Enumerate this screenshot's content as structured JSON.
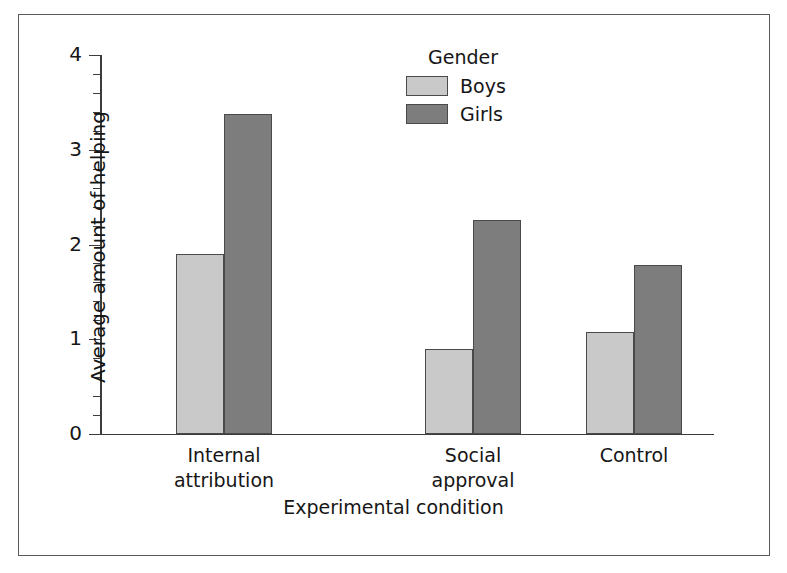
{
  "chart_data": {
    "type": "bar",
    "title": "",
    "subtitle": "",
    "xlabel": "Experimental condition",
    "ylabel": "Average amount of helping",
    "categories": [
      "Internal\nattribution",
      "Social\napproval",
      "Control"
    ],
    "series": [
      {
        "name": "Boys",
        "values": [
          1.9,
          0.9,
          1.08
        ],
        "color": "#c9c9c9"
      },
      {
        "name": "Girls",
        "values": [
          3.38,
          2.26,
          1.78
        ],
        "color": "#7d7d7d"
      }
    ],
    "legend": {
      "title": "Gender",
      "position": "top-center-right",
      "entries": [
        "Boys",
        "Girls"
      ]
    },
    "ylim": [
      0,
      4
    ],
    "yticks": [
      0,
      1,
      2,
      3,
      4
    ],
    "ytick_labels": [
      "0",
      "1",
      "2",
      "3",
      "4"
    ],
    "yminor_tick_interval": 0.2,
    "grid": false,
    "bar_gap_within_group": 0,
    "frame": true
  },
  "axis": {
    "y_labels": [
      "4",
      "3",
      "2",
      "1",
      "0"
    ],
    "title_y": "Average amount of helping",
    "title_x": "Experimental condition"
  },
  "legend": {
    "title": "Gender",
    "items": [
      {
        "label": "Boys",
        "color": "#c9c9c9"
      },
      {
        "label": "Girls",
        "color": "#7d7d7d"
      }
    ]
  },
  "groups": [
    {
      "label": "Internal\nattribution",
      "boys": 1.9,
      "girls": 3.38
    },
    {
      "label": "Social\napproval",
      "boys": 0.9,
      "girls": 2.26
    },
    {
      "label": "Control",
      "boys": 1.08,
      "girls": 1.78
    }
  ],
  "colors": {
    "boys": "#c9c9c9",
    "girls": "#7d7d7d",
    "axis": "#3c3c3c",
    "bar_outline": "#4a4a4a",
    "frame": "#5a5a5a",
    "text": "#161616",
    "background": "#ffffff"
  }
}
